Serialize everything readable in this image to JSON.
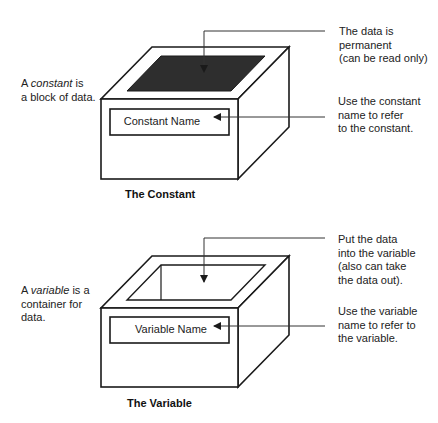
{
  "constant": {
    "description_prefix": "A ",
    "description_term": "constant",
    "description_suffix_line1": " is",
    "description_line2": "a block of data.",
    "box_label": "Constant Name",
    "callout_top": [
      "The data is",
      "permanent",
      "(can be read only)"
    ],
    "callout_name": [
      "Use the constant",
      "name to refer",
      "to the constant."
    ],
    "caption": "The Constant",
    "top_fill": "#2e2e2e"
  },
  "variable": {
    "description_prefix": "A ",
    "description_term": "variable",
    "description_suffix_line1": " is a",
    "description_line2": "container for",
    "description_line3": "data.",
    "box_label": "Variable Name",
    "callout_top": [
      "Put the data",
      "into the variable",
      "(also can take",
      "the data out)."
    ],
    "callout_name": [
      "Use the variable",
      "name to refer to",
      "the variable."
    ],
    "caption": "The Variable"
  },
  "colors": {
    "line": "#1a1a1a",
    "background": "#ffffff"
  }
}
